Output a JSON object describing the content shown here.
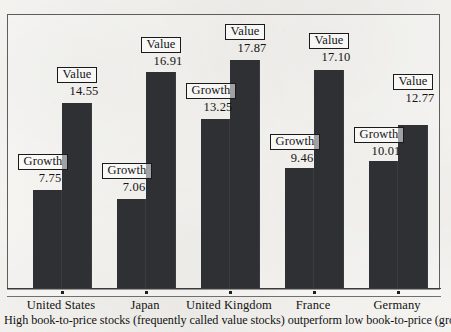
{
  "chart_data": {
    "type": "bar",
    "title": "",
    "subtitle": "",
    "xlabel": "",
    "ylabel": "",
    "grid": false,
    "legend_position": "none",
    "axis_baseline": 0,
    "ylim": [
      0,
      19.5
    ],
    "categories": [
      "United States",
      "Japan",
      "United Kingdom",
      "France",
      "Germany"
    ],
    "series": [
      {
        "name": "Growth",
        "values": [
          7.75,
          7.06,
          13.25,
          9.46,
          10.01
        ],
        "color": "#2f3033"
      },
      {
        "name": "Value",
        "values": [
          14.55,
          16.91,
          17.87,
          17.1,
          12.77
        ],
        "color": "#2f3033"
      }
    ],
    "annotations": [
      {
        "group": "United States",
        "series": "Growth",
        "box_label": "Growth",
        "value_label": "7.75"
      },
      {
        "group": "United States",
        "series": "Value",
        "box_label": "Value",
        "value_label": "14.55"
      },
      {
        "group": "Japan",
        "series": "Growth",
        "box_label": "Growth",
        "value_label": "7.06"
      },
      {
        "group": "Japan",
        "series": "Value",
        "box_label": "Value",
        "value_label": "16.91"
      },
      {
        "group": "United Kingdom",
        "series": "Growth",
        "box_label": "Growth",
        "value_label": "13.25"
      },
      {
        "group": "United Kingdom",
        "series": "Value",
        "box_label": "Value",
        "value_label": "17.87"
      },
      {
        "group": "France",
        "series": "Growth",
        "box_label": "Growth",
        "value_label": "9.46"
      },
      {
        "group": "France",
        "series": "Value",
        "box_label": "Value",
        "value_label": "17.10"
      },
      {
        "group": "Germany",
        "series": "Growth",
        "box_label": "Growth",
        "value_label": "10.01"
      },
      {
        "group": "Germany",
        "series": "Value",
        "box_label": "Value",
        "value_label": "12.77"
      }
    ]
  },
  "caption": {
    "text": "High book-to-price stocks (frequently called value stocks) outperform low book-to-price (growth) stocks"
  },
  "axis": {
    "tick_labels": [
      "United States",
      "Japan",
      "United Kingdom",
      "France",
      "Germany"
    ]
  },
  "annotations_flat": {
    "us_growth_label": "Growth",
    "us_growth_value": "7.75",
    "us_value_label": "Value",
    "us_value_value": "14.55",
    "jp_growth_label": "Growth",
    "jp_growth_value": "7.06",
    "jp_value_label": "Value",
    "jp_value_value": "16.91",
    "uk_growth_label": "Growth",
    "uk_growth_value": "13.25",
    "uk_value_label": "Value",
    "uk_value_value": "17.87",
    "fr_growth_label": "Growth",
    "fr_growth_value": "9.46",
    "fr_value_label": "Value",
    "fr_value_value": "17.10",
    "de_growth_label": "Growth",
    "de_growth_value": "10.01",
    "de_value_label": "Value",
    "de_value_value": "12.77"
  },
  "colors": {
    "bar": "#2f3033",
    "paper": "#f3f2ef",
    "ink": "#141414",
    "frame": "#5d5d5d"
  }
}
